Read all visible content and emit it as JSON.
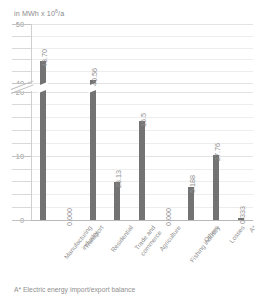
{
  "axis_caption": {
    "prefix": "in MWh x 10",
    "exponent": "6",
    "suffix": "/a"
  },
  "footnote": "A* Electric energy import/export balance",
  "colors": {
    "bar": "#737373",
    "text": "#8f8f8f",
    "gridline": "#ededed",
    "axis": "#b8b8b8"
  },
  "chart_data": {
    "type": "bar",
    "title": "",
    "subtitle": "",
    "xlabel": "",
    "ylabel": "in MWh x 10^6/a",
    "ylim": [
      0,
      50
    ],
    "grid": true,
    "legend": "none",
    "axis_break": {
      "from": 20,
      "to": 40,
      "note": "y-axis broken between 20 and 40"
    },
    "ytick_labels": [
      "0",
      "10",
      "20",
      "40",
      "50"
    ],
    "ytick_values": [
      0,
      10,
      20,
      40,
      50
    ],
    "minor_tick_values": [
      2,
      4,
      6,
      8,
      12,
      14,
      16,
      18,
      42,
      44,
      46,
      48
    ],
    "categories": [
      "Manufacturing industry",
      "Transport",
      "Residential",
      "Trade and commerce",
      "Agriculture",
      "Fishing industry",
      "Others",
      "Losses",
      "A*"
    ],
    "category_lines": [
      [
        "Manufacturing",
        "industry"
      ],
      [
        "Transport"
      ],
      [
        "Residential"
      ],
      [
        "Trade and",
        "commerce"
      ],
      [
        "Agriculture"
      ],
      [
        "Fishing industry"
      ],
      [
        "Others"
      ],
      [
        "Losses"
      ],
      [
        "A*"
      ]
    ],
    "values": [
      43.7,
      0.0,
      40.56,
      23.13,
      15.5,
      0.0,
      5.188,
      27.76,
      0.333
    ],
    "value_labels": [
      "43.70",
      "0.000",
      "40.56",
      "23.13",
      "15.5",
      "0.000",
      "5.188",
      "27.76",
      "0.333"
    ]
  }
}
